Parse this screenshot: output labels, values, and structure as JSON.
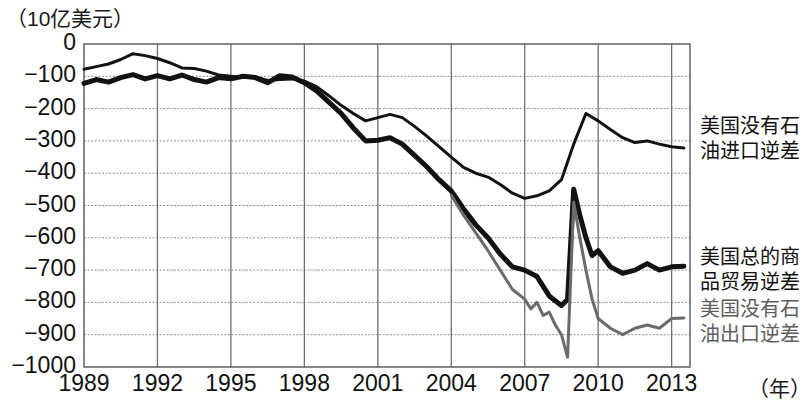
{
  "chart_data": {
    "type": "line",
    "title": "",
    "unit_label": "（10亿美元）",
    "xlabel": "（年）",
    "ylabel": "",
    "xlim": [
      1989,
      2013.75
    ],
    "ylim": [
      -1000,
      0
    ],
    "grid": true,
    "legend_position": "right",
    "y_ticks": [
      0,
      -100,
      -200,
      -300,
      -400,
      -500,
      -600,
      -700,
      -800,
      -900,
      -1000
    ],
    "y_tick_labels": [
      "0",
      "−100",
      "−200",
      "−300",
      "−400",
      "−500",
      "−600",
      "−700",
      "−800",
      "−900",
      "−1000"
    ],
    "x_ticks": [
      1989,
      1992,
      1995,
      1998,
      2001,
      2004,
      2007,
      2010,
      2013
    ],
    "x_tick_labels": [
      "1989",
      "1992",
      "1995",
      "1998",
      "2001",
      "2004",
      "2007",
      "2010",
      "2013"
    ],
    "series": [
      {
        "name": "美国没有石油进口逆差",
        "color": "#121212",
        "width": 3.0,
        "x": [
          1989.0,
          1989.5,
          1990.0,
          1990.5,
          1991.0,
          1991.5,
          1992.0,
          1992.5,
          1993.0,
          1993.5,
          1994.0,
          1994.5,
          1995.0,
          1995.5,
          1996.0,
          1996.5,
          1997.0,
          1997.5,
          1998.0,
          1998.5,
          1999.0,
          1999.5,
          2000.0,
          2000.5,
          2001.0,
          2001.5,
          2002.0,
          2002.5,
          2003.0,
          2003.5,
          2004.0,
          2004.5,
          2005.0,
          2005.5,
          2006.0,
          2006.5,
          2007.0,
          2007.5,
          2008.0,
          2008.5,
          2009.0,
          2009.5,
          2010.0,
          2010.5,
          2011.0,
          2011.5,
          2012.0,
          2012.5,
          2013.0,
          2013.5
        ],
        "y": [
          -78,
          -70,
          -62,
          -48,
          -30,
          -36,
          -45,
          -58,
          -74,
          -76,
          -84,
          -96,
          -100,
          -104,
          -102,
          -113,
          -110,
          -108,
          -115,
          -132,
          -160,
          -190,
          -215,
          -238,
          -228,
          -218,
          -228,
          -255,
          -285,
          -318,
          -350,
          -382,
          -400,
          -412,
          -435,
          -462,
          -478,
          -470,
          -455,
          -420,
          -310,
          -215,
          -238,
          -265,
          -290,
          -305,
          -300,
          -310,
          -318,
          -322
        ]
      },
      {
        "name": "美国总的商品贸易逆差",
        "color": "#121212",
        "width": 5.0,
        "x": [
          1989.0,
          1989.5,
          1990.0,
          1990.5,
          1991.0,
          1991.5,
          1992.0,
          1992.5,
          1993.0,
          1993.5,
          1994.0,
          1994.5,
          1995.0,
          1995.5,
          1996.0,
          1996.5,
          1997.0,
          1997.5,
          1998.0,
          1998.5,
          1999.0,
          1999.5,
          2000.0,
          2000.5,
          2001.0,
          2001.5,
          2002.0,
          2002.5,
          2003.0,
          2003.5,
          2004.0,
          2004.5,
          2005.0,
          2005.5,
          2006.0,
          2006.5,
          2007.0,
          2007.5,
          2008.0,
          2008.5,
          2008.75,
          2009.0,
          2009.25,
          2009.5,
          2009.75,
          2010.0,
          2010.5,
          2011.0,
          2011.5,
          2012.0,
          2012.5,
          2013.0,
          2013.5
        ],
        "y": [
          -122,
          -110,
          -118,
          -104,
          -95,
          -108,
          -98,
          -108,
          -96,
          -110,
          -118,
          -104,
          -108,
          -100,
          -104,
          -120,
          -98,
          -102,
          -120,
          -145,
          -180,
          -215,
          -260,
          -300,
          -298,
          -290,
          -310,
          -345,
          -380,
          -420,
          -455,
          -510,
          -560,
          -600,
          -650,
          -690,
          -700,
          -720,
          -780,
          -810,
          -790,
          -450,
          -530,
          -600,
          -655,
          -640,
          -690,
          -710,
          -700,
          -680,
          -700,
          -690,
          -688
        ]
      },
      {
        "name": "美国没有石油出口逆差",
        "color": "#6b6b6b",
        "width": 3.0,
        "x": [
          2004.0,
          2004.5,
          2005.0,
          2005.5,
          2006.0,
          2006.5,
          2007.0,
          2007.25,
          2007.5,
          2007.75,
          2008.0,
          2008.25,
          2008.5,
          2008.75,
          2009.0,
          2009.25,
          2009.5,
          2009.75,
          2010.0,
          2010.5,
          2011.0,
          2011.5,
          2012.0,
          2012.5,
          2013.0,
          2013.5
        ],
        "y": [
          -468,
          -530,
          -585,
          -640,
          -700,
          -760,
          -790,
          -820,
          -800,
          -840,
          -830,
          -870,
          -900,
          -970,
          -490,
          -600,
          -700,
          -790,
          -850,
          -880,
          -900,
          -880,
          -870,
          -880,
          -850,
          -848
        ]
      }
    ],
    "legend_entries": [
      {
        "id": "no-oil-imports",
        "lines": [
          "美国没有石油",
          "油进口逆差"
        ],
        "full_text": "美国没有石油进口逆差",
        "color": "#121212",
        "style": "bold-black"
      },
      {
        "id": "total-goods-trade",
        "lines": [
          "美国总的商",
          "品贸易逆差"
        ],
        "full_text": "美国总的商品贸易逆差",
        "color": "#121212",
        "style": "bold-black"
      },
      {
        "id": "no-oil-exports",
        "lines": [
          "美国没有石",
          "油出口逆差"
        ],
        "full_text": "美国没有石油出口逆差",
        "color": "#5e5e5e",
        "style": "gray"
      }
    ]
  },
  "legend": {
    "entry0_line0": "美国没有石",
    "entry0_line1": "油进口逆差",
    "entry1_line0": "美国总的商",
    "entry1_line1": "品贸易逆差",
    "entry2_line0": "美国没有石",
    "entry2_line1": "油出口逆差"
  },
  "axes": {
    "unit_title": "（10亿美元）",
    "x_unit": "（年）",
    "y0": "0",
    "y1": "−100",
    "y2": "−200",
    "y3": "−300",
    "y4": "−400",
    "y5": "−500",
    "y6": "−600",
    "y7": "−700",
    "y8": "−800",
    "y9": "−900",
    "y10": "−1000",
    "x0": "1989",
    "x1": "1992",
    "x2": "1995",
    "x3": "1998",
    "x4": "2001",
    "x5": "2004",
    "x6": "2007",
    "x7": "2010",
    "x8": "2013"
  }
}
